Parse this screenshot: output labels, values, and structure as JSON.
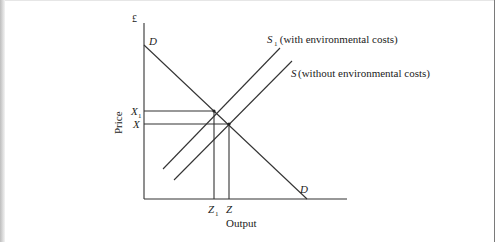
{
  "diagram": {
    "type": "supply-demand",
    "colors": {
      "line": "#333333",
      "text": "#222222",
      "background": "#ffffff"
    },
    "axes": {
      "y_symbol": "£",
      "y_label": "Price",
      "x_label": "Output"
    },
    "curves": {
      "demand": {
        "label_top": "D",
        "label_bottom": "D"
      },
      "supply_with_costs": {
        "symbol": "S",
        "subscript": "1",
        "desc": " (with environmental costs)"
      },
      "supply_without_costs": {
        "symbol": "S",
        "desc": "(without environmental costs)"
      }
    },
    "price_ticks": [
      {
        "symbol": "X",
        "subscript": "1"
      },
      {
        "symbol": "X",
        "subscript": ""
      }
    ],
    "output_ticks": [
      {
        "symbol": "Z",
        "subscript": "1"
      },
      {
        "symbol": "Z",
        "subscript": ""
      }
    ]
  }
}
